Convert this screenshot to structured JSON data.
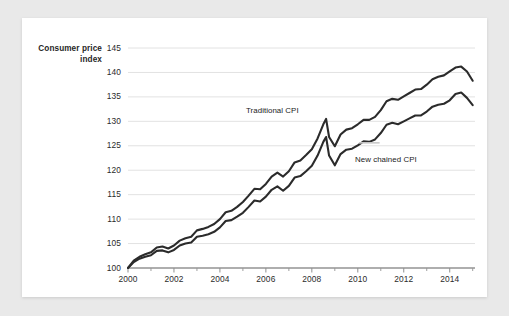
{
  "chart_data": {
    "type": "line",
    "title": "",
    "subtitle": "",
    "ylabel": "Consumer price index",
    "xlabel": "",
    "ylim": [
      100,
      145
    ],
    "xlim": [
      2000,
      2015.1
    ],
    "ytick_step": 5,
    "xtick_step": 2,
    "grid": "horizontal",
    "legend_position": "inline-annotation",
    "ytick_labels": [
      "100",
      "105",
      "110",
      "115",
      "120",
      "125",
      "130",
      "135",
      "140",
      "145"
    ],
    "xtick_labels": [
      "2000",
      "2002",
      "2004",
      "2006",
      "2008",
      "2010",
      "2012",
      "2014"
    ],
    "xtick_minor_years": [
      2001,
      2003,
      2005,
      2007,
      2009,
      2011,
      2013,
      2015
    ],
    "annotations": [
      {
        "name": "traditional-cpi-label",
        "text": "Traditional CPI",
        "x": 2006.4,
        "y": 131.5
      },
      {
        "name": "new-chained-cpi-label",
        "text": "New chained CPI",
        "x": 2010.9,
        "y": 121.2
      }
    ],
    "series": [
      {
        "name": "Traditional CPI",
        "color": "#2b2b2b",
        "x": [
          2000.0,
          2000.25,
          2000.5,
          2000.75,
          2001.0,
          2001.25,
          2001.5,
          2001.75,
          2002.0,
          2002.25,
          2002.5,
          2002.75,
          2003.0,
          2003.25,
          2003.5,
          2003.75,
          2004.0,
          2004.25,
          2004.5,
          2004.75,
          2005.0,
          2005.25,
          2005.5,
          2005.75,
          2006.0,
          2006.25,
          2006.5,
          2006.75,
          2007.0,
          2007.25,
          2007.5,
          2007.75,
          2008.0,
          2008.25,
          2008.5,
          2008.62,
          2008.75,
          2009.0,
          2009.25,
          2009.5,
          2009.75,
          2010.0,
          2010.25,
          2010.5,
          2010.75,
          2011.0,
          2011.25,
          2011.5,
          2011.75,
          2012.0,
          2012.25,
          2012.5,
          2012.75,
          2013.0,
          2013.25,
          2013.5,
          2013.75,
          2014.0,
          2014.25,
          2014.5,
          2014.75,
          2015.0
        ],
        "values": [
          100.0,
          101.2,
          101.9,
          102.3,
          102.6,
          103.5,
          103.6,
          103.2,
          103.7,
          104.6,
          105.0,
          105.2,
          106.4,
          106.6,
          106.9,
          107.4,
          108.3,
          109.6,
          109.8,
          110.5,
          111.3,
          112.5,
          113.8,
          113.6,
          114.6,
          116.0,
          116.7,
          115.8,
          116.8,
          118.5,
          118.8,
          119.8,
          120.9,
          123.0,
          125.8,
          126.8,
          123.0,
          121.0,
          123.3,
          124.2,
          124.4,
          125.1,
          125.9,
          125.8,
          126.3,
          127.6,
          129.3,
          129.7,
          129.4,
          130.0,
          130.6,
          131.2,
          131.2,
          132.0,
          133.0,
          133.4,
          133.6,
          134.3,
          135.6,
          135.9,
          134.8,
          133.3
        ]
      },
      {
        "name": "New chained CPI",
        "color": "#2b2b2b",
        "x": [
          2000.0,
          2000.25,
          2000.5,
          2000.75,
          2001.0,
          2001.25,
          2001.5,
          2001.75,
          2002.0,
          2002.25,
          2002.5,
          2002.75,
          2003.0,
          2003.25,
          2003.5,
          2003.75,
          2004.0,
          2004.25,
          2004.5,
          2004.75,
          2005.0,
          2005.25,
          2005.5,
          2005.75,
          2006.0,
          2006.25,
          2006.5,
          2006.75,
          2007.0,
          2007.25,
          2007.5,
          2007.75,
          2008.0,
          2008.25,
          2008.5,
          2008.62,
          2008.75,
          2009.0,
          2009.25,
          2009.5,
          2009.75,
          2010.0,
          2010.25,
          2010.5,
          2010.75,
          2011.0,
          2011.25,
          2011.5,
          2011.75,
          2012.0,
          2012.25,
          2012.5,
          2012.75,
          2013.0,
          2013.25,
          2013.5,
          2013.75,
          2014.0,
          2014.25,
          2014.5,
          2014.75,
          2015.0
        ],
        "values": [
          100.0,
          101.5,
          102.3,
          102.8,
          103.2,
          104.2,
          104.4,
          104.0,
          104.6,
          105.6,
          106.1,
          106.4,
          107.7,
          108.0,
          108.4,
          109.0,
          110.0,
          111.4,
          111.7,
          112.5,
          113.5,
          114.8,
          116.2,
          116.1,
          117.2,
          118.7,
          119.5,
          118.7,
          119.8,
          121.6,
          122.0,
          123.1,
          124.3,
          126.5,
          129.4,
          130.5,
          126.8,
          124.9,
          127.3,
          128.3,
          128.6,
          129.4,
          130.3,
          130.3,
          130.9,
          132.3,
          134.1,
          134.6,
          134.4,
          135.1,
          135.8,
          136.5,
          136.6,
          137.5,
          138.6,
          139.1,
          139.4,
          140.2,
          141.0,
          141.2,
          140.2,
          138.3
        ]
      }
    ]
  }
}
